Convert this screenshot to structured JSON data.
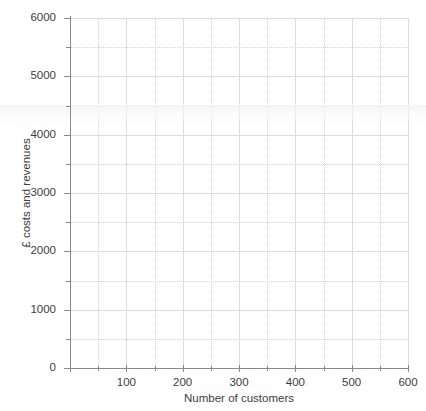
{
  "chart_data": {
    "type": "line",
    "title": "",
    "subtitle": "",
    "xlabel": "Number of customers",
    "ylabel": "£ costs and revenues",
    "xlim": [
      0,
      600
    ],
    "ylim": [
      0,
      6000
    ],
    "x_major_ticks": [
      0,
      100,
      200,
      300,
      400,
      500,
      600
    ],
    "x_major_tick_labels": [
      "",
      "100",
      "200",
      "300",
      "400",
      "500",
      "600"
    ],
    "x_minor_ticks": [
      50,
      150,
      250,
      350,
      450,
      550
    ],
    "y_major_ticks": [
      0,
      1000,
      2000,
      3000,
      4000,
      5000,
      6000
    ],
    "y_major_tick_labels": [
      "0",
      "1000",
      "2000",
      "3000",
      "4000",
      "5000",
      "6000"
    ],
    "y_minor_ticks": [
      500,
      1500,
      2500,
      3500,
      4500,
      5500
    ],
    "grid": {
      "major": true,
      "minor": true,
      "major_color": "#dcdcdc",
      "minor_color": "#d2d2d2",
      "minor_style": "dotted"
    },
    "legend": {
      "visible": false,
      "position": "none",
      "entries": []
    },
    "series": [],
    "annotations": [],
    "axis_color": "#8a8a8a",
    "text_color": "#3c3c3c",
    "background_color": "#ffffff",
    "note": "Blank plotting grid — axes drawn with no data series plotted"
  },
  "axis_titles": {
    "y": "£ costs and revenues",
    "x": "Number of customers"
  },
  "y_tick_labels": [
    "6000",
    "5000",
    "4000",
    "3000",
    "2000",
    "1000",
    "0"
  ],
  "x_tick_labels": [
    "100",
    "200",
    "300",
    "400",
    "500",
    "600"
  ]
}
